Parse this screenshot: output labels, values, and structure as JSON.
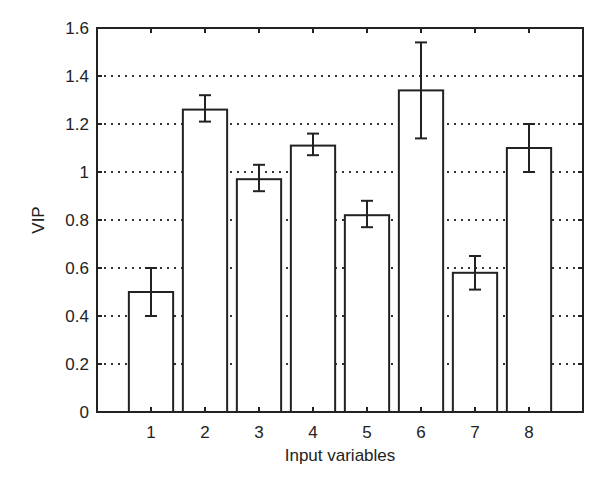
{
  "chart_data": {
    "type": "bar",
    "title": "",
    "xlabel": "Input variables",
    "ylabel": "VIP",
    "categories": [
      "1",
      "2",
      "3",
      "4",
      "5",
      "6",
      "7",
      "8"
    ],
    "values": [
      0.5,
      1.26,
      0.97,
      1.11,
      0.82,
      1.34,
      0.58,
      1.1
    ],
    "error_upper": [
      0.6,
      1.32,
      1.03,
      1.16,
      0.88,
      1.54,
      0.65,
      1.2
    ],
    "error_lower": [
      0.4,
      1.21,
      0.92,
      1.07,
      0.77,
      1.14,
      0.51,
      1.0
    ],
    "ylim": [
      0,
      1.6
    ],
    "xlim": [
      0,
      9
    ],
    "yticks": [
      0,
      0.2,
      0.4,
      0.6,
      0.8,
      1,
      1.2,
      1.4,
      1.6
    ],
    "ytick_labels": [
      "0",
      "0.2",
      "0.4",
      "0.6",
      "0.8",
      "1",
      "1.2",
      "1.4",
      "1.6"
    ],
    "grid": "y-dotted",
    "legend": null,
    "bar_fill": "#ffffff",
    "bar_edge": "#222222"
  }
}
